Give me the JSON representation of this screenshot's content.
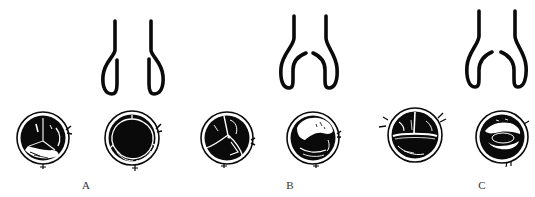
{
  "figure": {
    "colors": {
      "ink": "#0a0a0a",
      "background": "#ffffff",
      "label": "#333333"
    },
    "panels": [
      {
        "id": "A",
        "label": "A",
        "label_x": 76,
        "outflow_shape": "narrow tubular root with inward-curled sinus walls",
        "valve_views": [
          {
            "name": "valve-a-open-trileaflet",
            "cx": 43,
            "cy": 138,
            "r": 26
          },
          {
            "name": "valve-a-closed-trileaflet",
            "cx": 132,
            "cy": 138,
            "r": 27
          }
        ]
      },
      {
        "id": "B",
        "label": "B",
        "label_x": 280,
        "outflow_shape": "widened sinus bulb with leaflets curving inward",
        "valve_views": [
          {
            "name": "valve-b-trileaflet-commissures",
            "cx": 227,
            "cy": 138,
            "r": 26
          },
          {
            "name": "valve-b-coapted",
            "cx": 313,
            "cy": 138,
            "r": 26
          }
        ]
      },
      {
        "id": "C",
        "label": "C",
        "label_x": 472,
        "outflow_shape": "wide sinus bulb with leaflets nearly meeting centrally",
        "valve_views": [
          {
            "name": "valve-c-bicuspid-raphe",
            "cx": 415,
            "cy": 135,
            "r": 27
          },
          {
            "name": "valve-c-bicuspid-orifice",
            "cx": 502,
            "cy": 137,
            "r": 26
          }
        ]
      }
    ]
  }
}
